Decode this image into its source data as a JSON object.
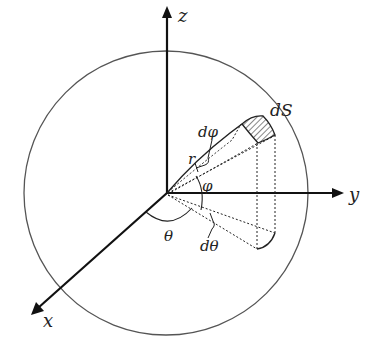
{
  "diagram": {
    "colors": {
      "background": "#ffffff",
      "stroke": "#1a1a1a",
      "sphere": "#555555"
    },
    "axes": {
      "z": {
        "label": "z"
      },
      "y": {
        "label": "y"
      },
      "x": {
        "label": "x"
      }
    },
    "labels": {
      "surface_element": "dS",
      "d_phi": "dφ",
      "radius": "r",
      "phi": "φ",
      "theta": "θ",
      "d_theta": "dθ"
    }
  }
}
